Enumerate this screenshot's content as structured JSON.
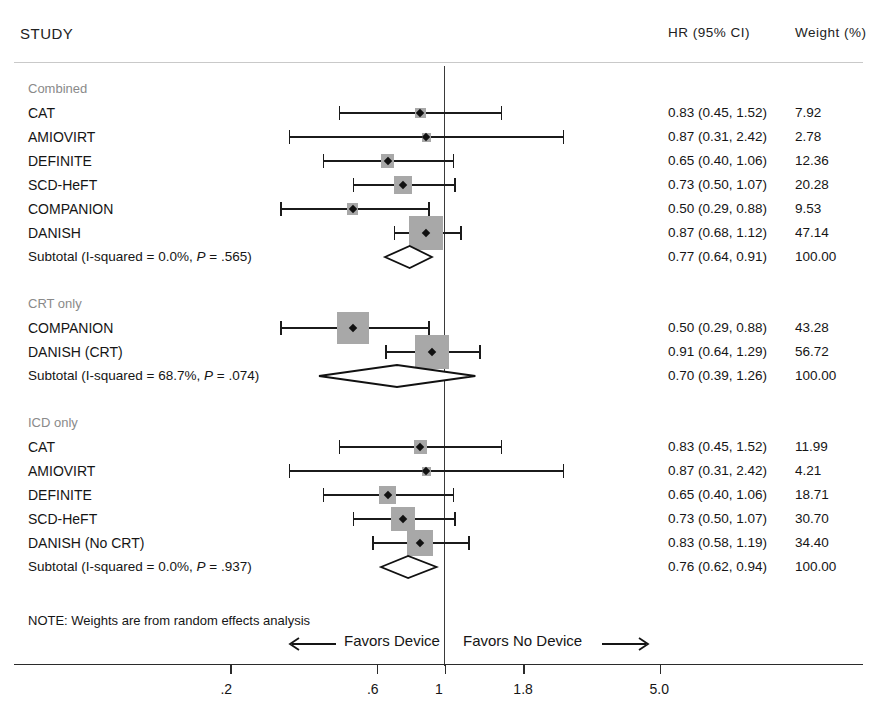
{
  "header": {
    "study_col": "STUDY",
    "effect_col": "HR (95% CI)",
    "weight_col": "Weight (%)"
  },
  "footer": {
    "note": "NOTE: Weights are from random effects analysis",
    "favors_left": "Favors Device",
    "favors_right": "Favors No Device",
    "left_arrow_icon": "arrow-left-icon",
    "right_arrow_icon": "arrow-right-icon"
  },
  "chart_data": {
    "type": "forest",
    "title": "",
    "xlabel": "",
    "scale": "log",
    "null_value": 1,
    "xlim": [
      0.15,
      6.2
    ],
    "ticks": [
      0.2,
      0.6,
      1,
      1.8,
      5.0
    ],
    "tick_labels": [
      ".2",
      ".6",
      "1",
      "1.8",
      "5.0"
    ],
    "columns": [
      "STUDY",
      "HR (95% CI)",
      "Weight (%)"
    ],
    "groups": [
      {
        "label": "Combined",
        "rows": [
          {
            "study": "CAT",
            "hr": 0.83,
            "lo": 0.45,
            "hi": 1.52,
            "ci_text": "0.83 (0.45, 1.52)",
            "weight": 7.92,
            "weight_text": "7.92"
          },
          {
            "study": "AMIOVIRT",
            "hr": 0.87,
            "lo": 0.31,
            "hi": 2.42,
            "ci_text": "0.87 (0.31, 2.42)",
            "weight": 2.78,
            "weight_text": "2.78"
          },
          {
            "study": "DEFINITE",
            "hr": 0.65,
            "lo": 0.4,
            "hi": 1.06,
            "ci_text": "0.65 (0.40, 1.06)",
            "weight": 12.36,
            "weight_text": "12.36"
          },
          {
            "study": "SCD-HeFT",
            "hr": 0.73,
            "lo": 0.5,
            "hi": 1.07,
            "ci_text": "0.73 (0.50, 1.07)",
            "weight": 20.28,
            "weight_text": "20.28"
          },
          {
            "study": "COMPANION",
            "hr": 0.5,
            "lo": 0.29,
            "hi": 0.88,
            "ci_text": "0.50 (0.29, 0.88)",
            "weight": 9.53,
            "weight_text": "9.53"
          },
          {
            "study": "DANISH",
            "hr": 0.87,
            "lo": 0.68,
            "hi": 1.12,
            "ci_text": "0.87 (0.68, 1.12)",
            "weight": 47.14,
            "weight_text": "47.14"
          }
        ],
        "subtotal": {
          "label_plain": "Subtotal  (I-squared = 0.0%, ",
          "label_italic": "P",
          "label_tail": " = .565)",
          "i_squared": "0.0%",
          "p_value": ".565",
          "hr": 0.77,
          "lo": 0.64,
          "hi": 0.91,
          "ci_text": "0.77 (0.64, 0.91)",
          "weight_text": "100.00"
        }
      },
      {
        "label": "CRT only",
        "rows": [
          {
            "study": "COMPANION",
            "hr": 0.5,
            "lo": 0.29,
            "hi": 0.88,
            "ci_text": "0.50 (0.29, 0.88)",
            "weight": 43.28,
            "weight_text": "43.28"
          },
          {
            "study": "DANISH (CRT)",
            "hr": 0.91,
            "lo": 0.64,
            "hi": 1.29,
            "ci_text": "0.91 (0.64, 1.29)",
            "weight": 56.72,
            "weight_text": "56.72"
          }
        ],
        "subtotal": {
          "label_plain": "Subtotal  (I-squared = 68.7%, ",
          "label_italic": "P",
          "label_tail": " = .074)",
          "i_squared": "68.7%",
          "p_value": ".074",
          "hr": 0.7,
          "lo": 0.39,
          "hi": 1.26,
          "ci_text": "0.70 (0.39, 1.26)",
          "weight_text": "100.00"
        }
      },
      {
        "label": "ICD only",
        "rows": [
          {
            "study": "CAT",
            "hr": 0.83,
            "lo": 0.45,
            "hi": 1.52,
            "ci_text": "0.83 (0.45, 1.52)",
            "weight": 11.99,
            "weight_text": "11.99"
          },
          {
            "study": "AMIOVIRT",
            "hr": 0.87,
            "lo": 0.31,
            "hi": 2.42,
            "ci_text": "0.87 (0.31, 2.42)",
            "weight": 4.21,
            "weight_text": "4.21"
          },
          {
            "study": "DEFINITE",
            "hr": 0.65,
            "lo": 0.4,
            "hi": 1.06,
            "ci_text": "0.65 (0.40, 1.06)",
            "weight": 18.71,
            "weight_text": "18.71"
          },
          {
            "study": "SCD-HeFT",
            "hr": 0.73,
            "lo": 0.5,
            "hi": 1.07,
            "ci_text": "0.73 (0.50, 1.07)",
            "weight": 30.7,
            "weight_text": "30.70"
          },
          {
            "study": "DANISH (No CRT)",
            "hr": 0.83,
            "lo": 0.58,
            "hi": 1.19,
            "ci_text": "0.83 (0.58, 1.19)",
            "weight": 34.4,
            "weight_text": "34.40"
          }
        ],
        "subtotal": {
          "label_plain": "Subtotal  (I-squared = 0.0%, ",
          "label_italic": "P",
          "label_tail": " = .937)",
          "i_squared": "0.0%",
          "p_value": ".937",
          "hr": 0.76,
          "lo": 0.62,
          "hi": 0.94,
          "ci_text": "0.76 (0.62, 0.94)",
          "weight_text": "100.00"
        }
      }
    ]
  },
  "colors": {
    "box_fill": "#a8a8a8",
    "line": "#1b1b1b",
    "null_line": "#3a3a3a",
    "group_label": "#8a8a8a",
    "rule": "#c9c9c9"
  }
}
